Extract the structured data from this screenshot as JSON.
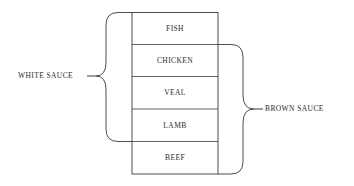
{
  "diagram": {
    "stack": [
      {
        "label": "FISH"
      },
      {
        "label": "CHICKEN"
      },
      {
        "label": "VEAL"
      },
      {
        "label": "LAMB"
      },
      {
        "label": "BEEF"
      }
    ],
    "groups": {
      "left": {
        "label": "WHITE SAUCE",
        "covers": [
          "FISH",
          "CHICKEN",
          "VEAL",
          "LAMB"
        ]
      },
      "right": {
        "label": "BROWN SAUCE",
        "covers": [
          "CHICKEN",
          "VEAL",
          "LAMB",
          "BEEF"
        ]
      }
    },
    "colors": {
      "line": "#3a3a3a",
      "text": "#2a2a2a",
      "background": "#ffffff"
    }
  }
}
